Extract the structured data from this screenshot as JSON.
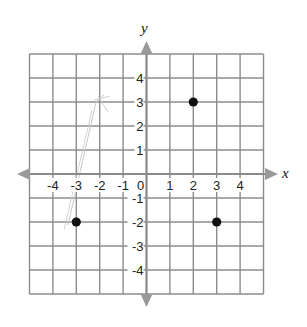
{
  "chart_data": {
    "type": "scatter",
    "title": "",
    "xlabel": "x",
    "ylabel": "y",
    "xlim": [
      -5,
      5
    ],
    "ylim": [
      -5,
      5
    ],
    "grid": true,
    "legend": null,
    "x_ticks": [
      -4,
      -3,
      -2,
      -1,
      0,
      1,
      2,
      3,
      4
    ],
    "y_ticks": [
      4,
      3,
      2,
      1,
      -1,
      -2,
      -3,
      -4
    ],
    "x_tick_labels": [
      "-4",
      "-3",
      "-2",
      "-1",
      "0",
      "1",
      "2",
      "3",
      "4"
    ],
    "y_tick_labels": [
      "4",
      "3",
      "2",
      "1",
      "-1",
      "-2",
      "-3",
      "-4"
    ],
    "points": [
      {
        "x": 2,
        "y": 3
      },
      {
        "x": 3,
        "y": -2
      },
      {
        "x": -3,
        "y": -2
      }
    ],
    "annotations": [
      "faint pencil sketch marks near x=-2.5"
    ]
  },
  "colors": {
    "grid": "#8c8c8c",
    "axis": "#8a8a8a",
    "arrow": "#999999",
    "point": "#111111",
    "pencil": "#c8c8c8"
  }
}
